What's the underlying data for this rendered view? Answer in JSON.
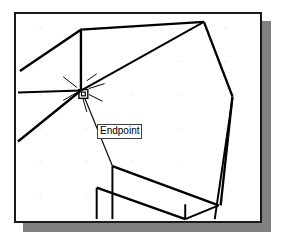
{
  "app": {
    "kind": "cad-viewport",
    "background_color": "#ffffff"
  },
  "viewport": {
    "name": "drawing-area",
    "border_color": "#1a1a1a",
    "fill_color": "#ffffff",
    "shadow_color": "#808080",
    "geometry_color": "#000000",
    "grid_dot_color": "#d9d9d9",
    "frame": {
      "x": 14,
      "y": 12,
      "width": 248,
      "height": 211
    }
  },
  "osnap": {
    "label": "Endpoint",
    "marker_name": "endpoint-square-marker",
    "marker_color": "#000000",
    "marker": {
      "x": 78,
      "y": 89,
      "size": 9
    },
    "tooltip_position": {
      "x": 81,
      "y": 110
    },
    "tooltip_bg": "#ffffff",
    "tooltip_border": "#3d3d3d"
  },
  "grid": {
    "dots": [
      [
        38,
        26
      ],
      [
        85,
        26
      ],
      [
        132,
        26
      ],
      [
        179,
        26
      ],
      [
        226,
        26
      ],
      [
        38,
        60
      ],
      [
        85,
        60
      ],
      [
        132,
        60
      ],
      [
        179,
        60
      ],
      [
        226,
        60
      ],
      [
        38,
        94
      ],
      [
        85,
        94
      ],
      [
        132,
        94
      ],
      [
        179,
        94
      ],
      [
        226,
        94
      ],
      [
        38,
        128
      ],
      [
        85,
        128
      ],
      [
        132,
        128
      ],
      [
        179,
        128
      ],
      [
        226,
        128
      ],
      [
        38,
        162
      ],
      [
        85,
        162
      ],
      [
        132,
        162
      ],
      [
        179,
        162
      ],
      [
        226,
        162
      ],
      [
        38,
        196
      ],
      [
        85,
        196
      ],
      [
        132,
        196
      ],
      [
        179,
        196
      ],
      [
        226,
        196
      ]
    ]
  },
  "chart_data": {
    "type": "line",
    "xlabel": "",
    "ylabel": "",
    "coordinate_space": "screenshot pixels (281x239)",
    "polylines": [
      {
        "name": "top-left-roof-edge",
        "points": [
          [
            18,
            70
          ],
          [
            80,
            28
          ],
          [
            205,
            20
          ]
        ],
        "weight": 2.4
      },
      {
        "name": "left-vertical-wall-edge",
        "points": [
          [
            80,
            28
          ],
          [
            80,
            90
          ]
        ],
        "weight": 2.4
      },
      {
        "name": "left-horizontal-ledge",
        "points": [
          [
            16,
            92
          ],
          [
            80,
            90
          ]
        ],
        "weight": 2.0
      },
      {
        "name": "left-lower-diagonal",
        "points": [
          [
            16,
            142
          ],
          [
            80,
            90
          ]
        ],
        "weight": 2.4
      },
      {
        "name": "ridge-to-apex",
        "points": [
          [
            80,
            90
          ],
          [
            205,
            20
          ]
        ],
        "weight": 2.0
      },
      {
        "name": "apex-right-descender",
        "points": [
          [
            205,
            20
          ],
          [
            234,
            96
          ]
        ],
        "weight": 2.4
      },
      {
        "name": "right-lower-descender",
        "points": [
          [
            234,
            96
          ],
          [
            222,
            207
          ]
        ],
        "weight": 2.4
      },
      {
        "name": "right-inner-descender",
        "points": [
          [
            234,
            98
          ],
          [
            216,
            221
          ]
        ],
        "weight": 2.0
      },
      {
        "name": "tooltip-leader-to-face",
        "points": [
          [
            84,
            98
          ],
          [
            112,
            167
          ]
        ],
        "weight": 1.2
      },
      {
        "name": "lower-face-top-diagonal",
        "points": [
          [
            112,
            167
          ],
          [
            220,
            207
          ]
        ],
        "weight": 2.4
      },
      {
        "name": "lower-face-left-vertical",
        "points": [
          [
            112,
            167
          ],
          [
            112,
            221
          ]
        ],
        "weight": 2.0
      },
      {
        "name": "lower-face-lower-diagonal",
        "points": [
          [
            96,
            189
          ],
          [
            186,
            221
          ]
        ],
        "weight": 2.4
      },
      {
        "name": "lower-face-bottom-left-edge",
        "points": [
          [
            96,
            189
          ],
          [
            96,
            221
          ]
        ],
        "weight": 2.0
      },
      {
        "name": "lower-right-vertical",
        "points": [
          [
            186,
            206
          ],
          [
            186,
            221
          ]
        ],
        "weight": 2.0
      },
      {
        "name": "lower-right-wedge",
        "points": [
          [
            186,
            221
          ],
          [
            220,
            207
          ]
        ],
        "weight": 2.0
      }
    ],
    "aperture_rays": [
      [
        [
          62,
          76
        ],
        [
          76,
          87
        ]
      ],
      [
        [
          62,
          100
        ],
        [
          76,
          92
        ]
      ],
      [
        [
          68,
          90
        ],
        [
          76,
          90
        ]
      ],
      [
        [
          86,
          80
        ],
        [
          96,
          73
        ]
      ],
      [
        [
          88,
          88
        ],
        [
          104,
          83
        ]
      ],
      [
        [
          88,
          94
        ],
        [
          102,
          101
        ]
      ],
      [
        [
          82,
          98
        ],
        [
          86,
          112
        ]
      ]
    ]
  }
}
